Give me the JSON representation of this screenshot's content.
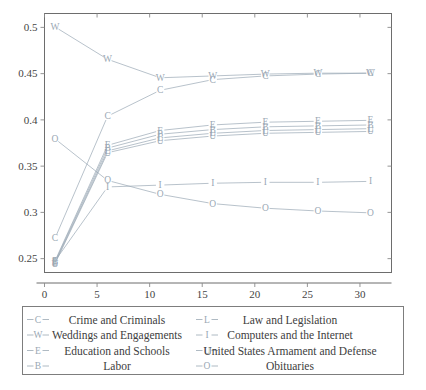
{
  "chart_data": {
    "type": "line",
    "title": "",
    "subtitle": "",
    "xlabel": "",
    "ylabel": "",
    "xlim": [
      0,
      33
    ],
    "ylim": [
      0.235,
      0.515
    ],
    "x": [
      1,
      6,
      11,
      16,
      21,
      26,
      31
    ],
    "xticks": [
      0,
      5,
      10,
      15,
      20,
      25,
      30
    ],
    "yticks": [
      0.25,
      0.3,
      0.35,
      0.4,
      0.45,
      0.5
    ],
    "ytick_labels": [
      "0.25",
      "0.3",
      "0.35",
      "0.4",
      "0.45",
      "0.5"
    ],
    "xtick_labels": [
      "0",
      "5",
      "10",
      "15",
      "20",
      "25",
      "30"
    ],
    "grid": false,
    "legend_position": "below",
    "legend_columns": 2,
    "series": [
      {
        "name": "Crime and Criminals",
        "marker": "C",
        "color": "#9aa8b4",
        "values": [
          0.272,
          0.404,
          0.432,
          0.4435,
          0.4475,
          0.4495,
          0.4505
        ]
      },
      {
        "name": "Weddings and Engagements",
        "marker": "W",
        "color": "#9aa8b4",
        "values": [
          0.5005,
          0.4655,
          0.4455,
          0.4475,
          0.4495,
          0.4505,
          0.4505
        ]
      },
      {
        "name": "Education and Schools",
        "marker": "E",
        "color": "#9aa8b4",
        "values": [
          0.2475,
          0.3725,
          0.3885,
          0.3945,
          0.3975,
          0.3985,
          0.3995
        ]
      },
      {
        "name": "Labor",
        "marker": "B",
        "color": "#9aa8b4",
        "values": [
          0.2465,
          0.3695,
          0.3845,
          0.3895,
          0.3925,
          0.3935,
          0.3945
        ]
      },
      {
        "name": "Law and Legislation",
        "marker": "L",
        "color": "#9aa8b4",
        "values": [
          0.2455,
          0.3665,
          0.3805,
          0.3855,
          0.3885,
          0.3895,
          0.3905
        ]
      },
      {
        "name": "Computers and the Internet",
        "marker": "I",
        "color": "#9aa8b4",
        "values": [
          0.2475,
          0.3275,
          0.3295,
          0.3315,
          0.3325,
          0.3325,
          0.3335
        ]
      },
      {
        "name": "United States Armament and Defense",
        "marker": "U",
        "color": "#9aa8b4",
        "values": [
          0.2445,
          0.3645,
          0.3775,
          0.3825,
          0.3855,
          0.3865,
          0.3875
        ]
      },
      {
        "name": "Obituaries",
        "marker": "O",
        "color": "#9aa8b4",
        "values": [
          0.3795,
          0.3345,
          0.3195,
          0.3095,
          0.3045,
          0.3015,
          0.2995
        ]
      }
    ]
  },
  "legend": {
    "entries": [
      {
        "marker": "C",
        "label": "Crime and Criminals",
        "column": 0,
        "row": 0
      },
      {
        "marker": "L",
        "label": "Law and Legislation",
        "column": 1,
        "row": 0
      },
      {
        "marker": "W",
        "label": "Weddings and Engagements",
        "column": 0,
        "row": 1
      },
      {
        "marker": "I",
        "label": "Computers and the Internet",
        "column": 1,
        "row": 1
      },
      {
        "marker": "E",
        "label": "Education and Schools",
        "column": 0,
        "row": 2
      },
      {
        "marker": "U",
        "label": "United States Armament and Defense",
        "column": 1,
        "row": 2
      },
      {
        "marker": "B",
        "label": "Labor",
        "column": 0,
        "row": 3
      },
      {
        "marker": "O",
        "label": "Obituaries",
        "column": 1,
        "row": 3
      }
    ]
  },
  "colors": {
    "axis": "#6d6d6d",
    "series": "#9aa8b4",
    "text": "#3d3d3d",
    "background": "#ffffff"
  }
}
